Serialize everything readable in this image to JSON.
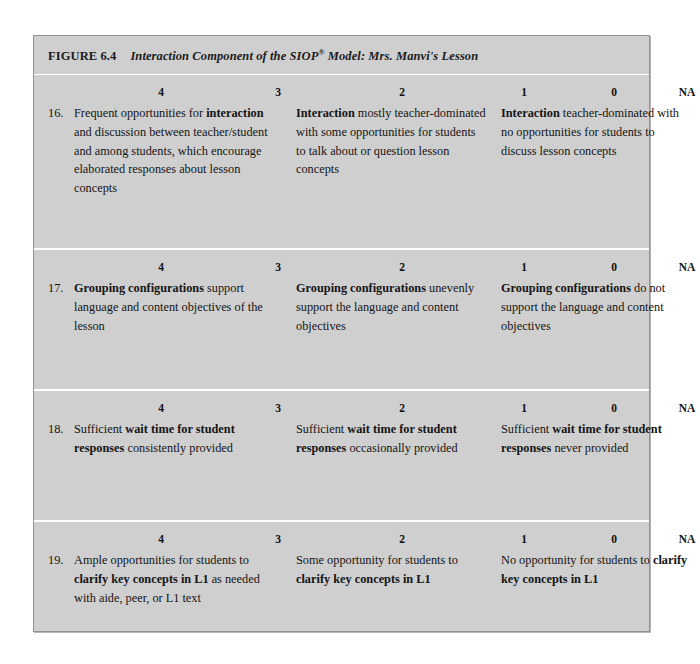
{
  "figure": {
    "label": "FIGURE 6.4",
    "caption_prefix": "Interaction Component of the SIOP",
    "caption_sup": "®",
    "caption_suffix": " Model: Mrs. Manvi's Lesson",
    "background_color": "#cfcfcf",
    "border_color": "#8f9195",
    "page_background": "#ffffff"
  },
  "scale": {
    "labels": [
      "4",
      "3",
      "2",
      "1",
      "0",
      "NA"
    ]
  },
  "rows": [
    {
      "number": "16.",
      "scale": [
        "4",
        "3",
        "2",
        "1",
        "0",
        "NA"
      ],
      "columns": [
        {
          "anchor": "4",
          "segments": [
            {
              "text": "Frequent opportunities for ",
              "bold": false
            },
            {
              "text": "interaction",
              "bold": true
            },
            {
              "text": " and discussion between teacher/student and among students, which encourage elaborated responses about lesson concepts",
              "bold": false
            }
          ]
        },
        {
          "anchor": "2",
          "segments": [
            {
              "text": "Interaction",
              "bold": true
            },
            {
              "text": " mostly teacher-dominated with some opportunities for students to talk about or question lesson concepts",
              "bold": false
            }
          ]
        },
        {
          "anchor": "0",
          "segments": [
            {
              "text": "Interaction",
              "bold": true
            },
            {
              "text": " teacher-dominated with no opportunities for students to discuss lesson concepts",
              "bold": false
            }
          ]
        }
      ]
    },
    {
      "number": "17.",
      "scale": [
        "4",
        "3",
        "2",
        "1",
        "0",
        "NA"
      ],
      "columns": [
        {
          "anchor": "4",
          "segments": [
            {
              "text": "Grouping configurations",
              "bold": true
            },
            {
              "text": " support language and content objectives of the lesson",
              "bold": false
            }
          ]
        },
        {
          "anchor": "2",
          "segments": [
            {
              "text": "Grouping configurations",
              "bold": true
            },
            {
              "text": " unevenly support the language and content objectives",
              "bold": false
            }
          ]
        },
        {
          "anchor": "0",
          "segments": [
            {
              "text": "Grouping configurations",
              "bold": true
            },
            {
              "text": " do not support the language and content objectives",
              "bold": false
            }
          ]
        }
      ]
    },
    {
      "number": "18.",
      "scale": [
        "4",
        "3",
        "2",
        "1",
        "0",
        "NA"
      ],
      "columns": [
        {
          "anchor": "4",
          "segments": [
            {
              "text": "Sufficient ",
              "bold": false
            },
            {
              "text": "wait time for student responses",
              "bold": true
            },
            {
              "text": " consistently provided",
              "bold": false
            }
          ]
        },
        {
          "anchor": "2",
          "segments": [
            {
              "text": "Sufficient ",
              "bold": false
            },
            {
              "text": "wait time for student responses",
              "bold": true
            },
            {
              "text": " occasionally provided",
              "bold": false
            }
          ]
        },
        {
          "anchor": "0",
          "segments": [
            {
              "text": "Sufficient ",
              "bold": false
            },
            {
              "text": "wait time for student responses",
              "bold": true
            },
            {
              "text": " never provided",
              "bold": false
            }
          ]
        }
      ]
    },
    {
      "number": "19.",
      "scale": [
        "4",
        "3",
        "2",
        "1",
        "0",
        "NA"
      ],
      "columns": [
        {
          "anchor": "4",
          "segments": [
            {
              "text": "Ample opportunities for students to ",
              "bold": false
            },
            {
              "text": "clarify key concepts in L1",
              "bold": true
            },
            {
              "text": " as needed with aide, peer, or L1 text",
              "bold": false
            }
          ]
        },
        {
          "anchor": "2",
          "segments": [
            {
              "text": "Some opportunity for students to ",
              "bold": false
            },
            {
              "text": "clarify key concepts in L1",
              "bold": true
            }
          ]
        },
        {
          "anchor": "0",
          "segments": [
            {
              "text": "No opportunity for students to ",
              "bold": false
            },
            {
              "text": "clarify key concepts in L1",
              "bold": true
            }
          ]
        }
      ]
    }
  ]
}
